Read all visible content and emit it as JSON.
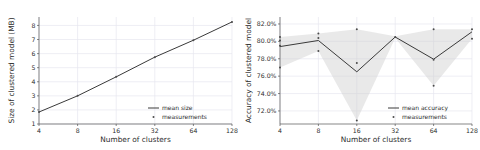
{
  "figure": {
    "background_color": "#ffffff",
    "grid_color": "#e6e6ef",
    "line_color": "#3a3a3a",
    "marker_color": "#4a4a4a",
    "band_color": "#cfcfcf",
    "text_color": "#2b2b2b"
  },
  "chart_data": [
    {
      "type": "line",
      "id": "size-chart",
      "title": "",
      "xlabel": "Number of clusters",
      "ylabel": "Size of clustered model (MB)",
      "x": [
        4,
        8,
        16,
        32,
        64,
        128
      ],
      "xticklabels": [
        "4",
        "8",
        "16",
        "32",
        "64",
        "128"
      ],
      "xscale": "log2",
      "xlim": [
        4,
        128
      ],
      "ylim": [
        1,
        8.6
      ],
      "yticks": [
        1,
        2,
        3,
        4,
        5,
        6,
        7,
        8
      ],
      "yticklabels": [
        "1",
        "2",
        "3",
        "4",
        "5",
        "6",
        "7",
        "8"
      ],
      "grid": true,
      "legend_position": "lower right",
      "series": [
        {
          "name": "mean size",
          "kind": "line",
          "values": [
            1.85,
            3.0,
            4.35,
            5.75,
            6.95,
            8.25
          ]
        },
        {
          "name": "measurements",
          "kind": "scatter",
          "points": [
            {
              "x": 4,
              "y": 1.85
            },
            {
              "x": 8,
              "y": 3.0
            },
            {
              "x": 16,
              "y": 4.35
            },
            {
              "x": 32,
              "y": 5.75
            },
            {
              "x": 64,
              "y": 6.95
            },
            {
              "x": 128,
              "y": 8.25
            }
          ]
        }
      ]
    },
    {
      "type": "line",
      "id": "accuracy-chart",
      "title": "",
      "xlabel": "Number of clusters",
      "ylabel": "Accuracy of clustered model",
      "x": [
        4,
        8,
        16,
        32,
        64,
        128
      ],
      "xticklabels": [
        "4",
        "8",
        "16",
        "32",
        "64",
        "128"
      ],
      "xscale": "log2",
      "xlim": [
        4,
        128
      ],
      "ylim": [
        70.5,
        82.8
      ],
      "yticks": [
        72.0,
        74.0,
        76.0,
        78.0,
        80.0,
        82.0
      ],
      "yticklabels": [
        "72.0%",
        "74.0%",
        "76.0%",
        "78.0%",
        "80.0%",
        "82.0%"
      ],
      "grid": true,
      "legend_position": "lower right",
      "series": [
        {
          "name": "mean accuracy",
          "kind": "line",
          "values": [
            79.4,
            80.1,
            76.5,
            80.5,
            77.95,
            81.1
          ]
        },
        {
          "name": "measurements",
          "kind": "scatter",
          "points": [
            {
              "x": 4,
              "y": 80.5
            },
            {
              "x": 4,
              "y": 80.1
            },
            {
              "x": 4,
              "y": 79.5
            },
            {
              "x": 4,
              "y": 77.0
            },
            {
              "x": 8,
              "y": 80.9
            },
            {
              "x": 8,
              "y": 80.4
            },
            {
              "x": 8,
              "y": 78.9
            },
            {
              "x": 16,
              "y": 81.4
            },
            {
              "x": 16,
              "y": 77.5
            },
            {
              "x": 16,
              "y": 70.9
            },
            {
              "x": 32,
              "y": 80.5
            },
            {
              "x": 64,
              "y": 81.4
            },
            {
              "x": 64,
              "y": 77.9
            },
            {
              "x": 64,
              "y": 74.9
            },
            {
              "x": 128,
              "y": 81.4
            },
            {
              "x": 128,
              "y": 80.3
            }
          ]
        }
      ],
      "band": {
        "name": "spread",
        "upper": [
          80.5,
          80.9,
          81.4,
          80.6,
          81.4,
          81.4
        ],
        "lower": [
          77.0,
          78.9,
          70.9,
          80.4,
          74.9,
          80.3
        ]
      }
    }
  ]
}
